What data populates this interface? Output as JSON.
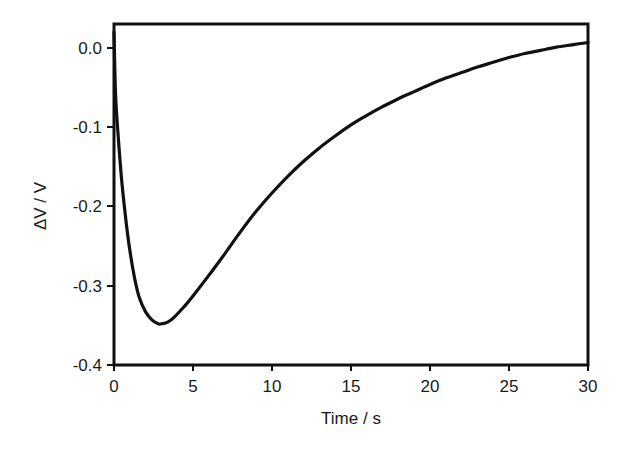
{
  "chart_data": {
    "type": "line",
    "title": "",
    "xlabel": "Time / s",
    "ylabel": "ΔV / V",
    "xlim": [
      0,
      30
    ],
    "ylim": [
      -0.4,
      0.03
    ],
    "grid": false,
    "legend": null,
    "x_ticks": [
      "0",
      "5",
      "10",
      "15",
      "20",
      "25",
      "30"
    ],
    "y_ticks": [
      "0.0",
      "-0.1",
      "-0.2",
      "-0.3",
      "-0.4"
    ],
    "series": [
      {
        "name": "ΔV",
        "color": "#111111",
        "x": [
          0,
          0.1,
          0.3,
          0.5,
          0.8,
          1.0,
          1.3,
          1.6,
          2.0,
          2.4,
          2.8,
          3.0,
          3.4,
          3.8,
          4.5,
          5.0,
          6.0,
          7.0,
          8.0,
          9.0,
          10.0,
          11.0,
          12.0,
          13.0,
          14.0,
          15.0,
          16.0,
          17.0,
          18.0,
          19.0,
          20.0,
          21.0,
          22.0,
          23.0,
          24.0,
          25.0,
          26.0,
          27.0,
          28.0,
          29.0,
          30.0
        ],
        "y": [
          0.02,
          -0.06,
          -0.12,
          -0.17,
          -0.225,
          -0.255,
          -0.29,
          -0.315,
          -0.333,
          -0.343,
          -0.348,
          -0.348,
          -0.346,
          -0.34,
          -0.325,
          -0.313,
          -0.287,
          -0.26,
          -0.232,
          -0.206,
          -0.183,
          -0.162,
          -0.143,
          -0.126,
          -0.111,
          -0.097,
          -0.085,
          -0.074,
          -0.064,
          -0.055,
          -0.046,
          -0.038,
          -0.031,
          -0.024,
          -0.018,
          -0.012,
          -0.007,
          -0.003,
          0.001,
          0.004,
          0.007
        ]
      }
    ]
  },
  "plot": {
    "xlabel": "Time / s",
    "ylabel": "ΔV / V",
    "x_ticks": [
      "0",
      "5",
      "10",
      "15",
      "20",
      "25",
      "30"
    ],
    "y_ticks": [
      "0.0",
      "-0.1",
      "-0.2",
      "-0.3",
      "-0.4"
    ]
  }
}
